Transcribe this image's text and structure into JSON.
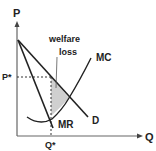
{
  "diagram": {
    "axes": {
      "y_label": "P",
      "x_label": "Q"
    },
    "curves": [
      {
        "name": "MC",
        "label": "MC"
      },
      {
        "name": "MR",
        "label": "MR"
      },
      {
        "name": "D",
        "label": "D"
      }
    ],
    "markers": {
      "price": "P*",
      "quantity": "Q*"
    },
    "annotation": {
      "line1": "welfare",
      "line2": "loss"
    },
    "colors": {
      "line": "#222222",
      "shade": "#cfcfcf",
      "background": "#ffffff"
    }
  }
}
